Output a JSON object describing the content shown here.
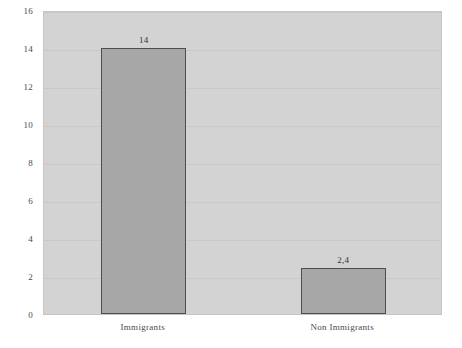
{
  "chart_data": {
    "type": "bar",
    "title": "",
    "subtitle": "",
    "xlabel": "",
    "ylabel": "",
    "categories": [
      "Immigrants",
      "Non Immigrants"
    ],
    "values": [
      14,
      2.4
    ],
    "value_labels": [
      "14",
      "2,4"
    ],
    "ylim": [
      0,
      16
    ],
    "y_ticks": [
      "0",
      "2",
      "4",
      "6",
      "8",
      "10",
      "12",
      "14",
      "16"
    ],
    "y_tick_values": [
      0,
      2,
      4,
      6,
      8,
      10,
      12,
      14,
      16
    ],
    "grid": true,
    "legend": false,
    "series": [
      {
        "name": "",
        "values": [
          14,
          2.4
        ]
      }
    ]
  },
  "style": {
    "plot_background": "#d3d3d3",
    "bar_fill": "#a7a7a7",
    "bar_border": "#4e4e4e",
    "gridline_color": "#c9c9c9",
    "text_color": "#4a4a4a"
  }
}
